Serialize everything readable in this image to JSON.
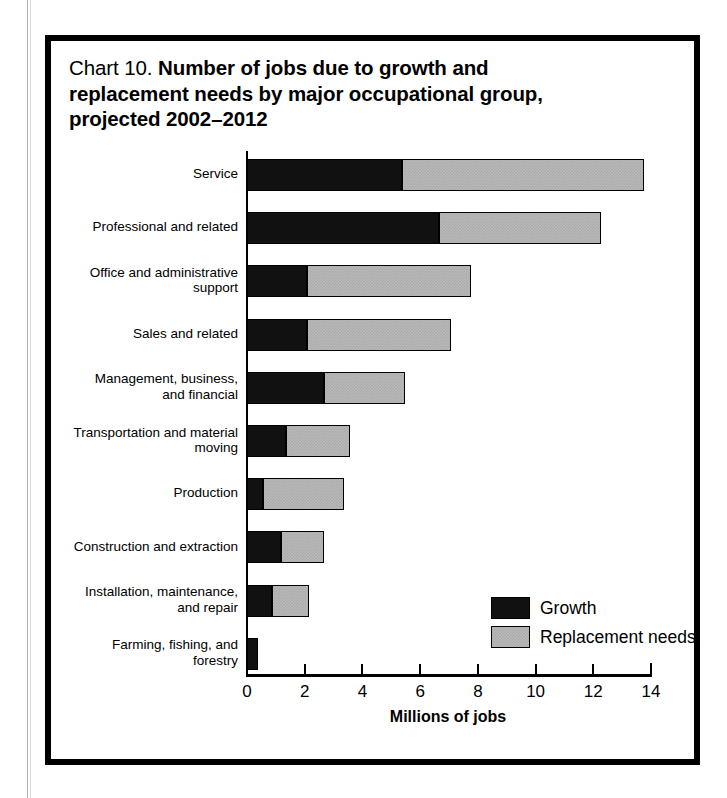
{
  "chart_data": {
    "type": "bar",
    "orientation": "horizontal",
    "stacked": true,
    "title_prefix": "Chart 10.",
    "title": "Number of jobs due to growth and replacement needs by major occupational group, projected 2002–2012",
    "title_line1": "Number of jobs due to growth and",
    "title_line2": "replacement needs by major occupational group,",
    "title_line3": "projected 2002–2012",
    "xlabel": "Millions of jobs",
    "ylabel": "",
    "xlim": [
      0,
      14
    ],
    "xticks": [
      0,
      2,
      4,
      6,
      8,
      10,
      12,
      14
    ],
    "xtick_labels": [
      "0",
      "2",
      "4",
      "6",
      "8",
      "10",
      "12",
      "14"
    ],
    "grid": false,
    "legend_position": "inside-right",
    "categories": [
      "Service",
      "Professional and related",
      "Office and administrative\nsupport",
      "Sales and related",
      "Management, business,\nand financial",
      "Transportation and material\nmoving",
      "Production",
      "Construction and extraction",
      "Installation, maintenance,\nand repair",
      "Farming, fishing, and\nforestry"
    ],
    "series": [
      {
        "name": "Growth",
        "color": "#111111",
        "values": [
          5.4,
          6.7,
          2.1,
          2.1,
          2.7,
          1.4,
          0.6,
          1.2,
          0.9,
          0.4
        ]
      },
      {
        "name": "Replacement needs",
        "color": "#b9b9b9",
        "values": [
          8.4,
          5.6,
          5.7,
          5.0,
          2.8,
          2.2,
          2.8,
          1.5,
          1.3,
          0.0
        ]
      }
    ],
    "totals": [
      13.8,
      12.3,
      7.8,
      7.1,
      5.5,
      3.6,
      3.4,
      2.7,
      2.2,
      0.4
    ]
  }
}
